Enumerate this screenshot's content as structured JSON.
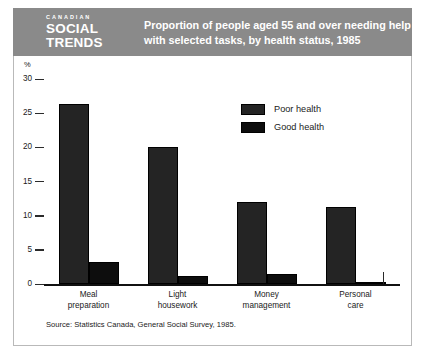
{
  "header": {
    "logo_kicker": "CANADIAN",
    "logo_line1": "SOCIAL",
    "logo_line2": "TRENDS",
    "title_line1": "Proportion of people aged 55 and over needing help",
    "title_line2": "with selected tasks, by health status, 1985",
    "band_color": "#8a8a8a",
    "text_color": "#ffffff"
  },
  "source_note": "Source: Statistics Canada, General Social Survey, 1985.",
  "chart_data": {
    "type": "bar",
    "title": "Proportion of people aged 55 and over needing help with selected tasks, by health status, 1985",
    "xlabel": "",
    "ylabel": "%",
    "ylim": [
      0,
      30
    ],
    "yticks": [
      0,
      5,
      10,
      15,
      20,
      25,
      30
    ],
    "ytick_labels": [
      "0",
      "5",
      "10",
      "15",
      "20",
      "25",
      "30"
    ],
    "grid": false,
    "legend_position": "upper-right-inside",
    "categories": [
      "Meal preparation",
      "Light housework",
      "Money management",
      "Personal care"
    ],
    "category_lines": [
      [
        "Meal",
        "preparation"
      ],
      [
        "Light",
        "housework"
      ],
      [
        "Money",
        "management"
      ],
      [
        "Personal",
        "care"
      ]
    ],
    "series": [
      {
        "name": "Poor health",
        "color": "#242424",
        "values": [
          26.3,
          20.0,
          12.0,
          11.2
        ]
      },
      {
        "name": "Good health",
        "color": "#0d0d0d",
        "values": [
          3.2,
          1.2,
          1.5,
          0.3
        ]
      }
    ]
  }
}
